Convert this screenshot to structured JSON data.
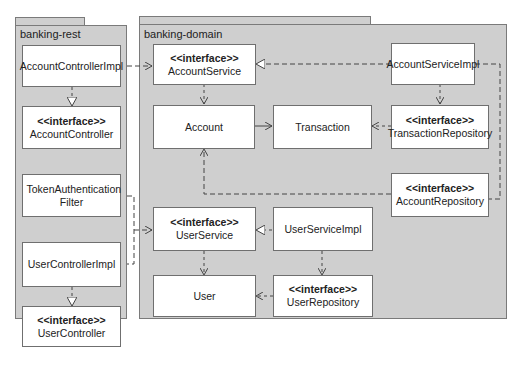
{
  "packages": {
    "rest": {
      "label": "banking-rest"
    },
    "domain": {
      "label": "banking-domain"
    }
  },
  "stereotype": "<<interface>>",
  "classes": {
    "account_controller_impl": {
      "name": "AccountControllerImpl"
    },
    "account_controller": {
      "name": "AccountController",
      "interface": true
    },
    "token_filter": {
      "name": "TokenAuthentication Filter"
    },
    "user_controller_impl": {
      "name": "UserControllerImpl"
    },
    "user_controller": {
      "name": "UserController",
      "interface": true
    },
    "account_service": {
      "name": "AccountService",
      "interface": true
    },
    "account_service_impl": {
      "name": "AccountServiceImpl"
    },
    "account": {
      "name": "Account"
    },
    "transaction": {
      "name": "Transaction"
    },
    "transaction_repository": {
      "name": "TransactionRepository",
      "interface": true
    },
    "account_repository": {
      "name": "AccountRepository",
      "interface": true
    },
    "user_service": {
      "name": "UserService",
      "interface": true
    },
    "user_service_impl": {
      "name": "UserServiceImpl"
    },
    "user": {
      "name": "User"
    },
    "user_repository": {
      "name": "UserRepository",
      "interface": true
    }
  },
  "colors": {
    "package_fill": "#cfcfcf",
    "border": "#6f6f6f",
    "box_fill": "#ffffff",
    "line": "#444444"
  }
}
